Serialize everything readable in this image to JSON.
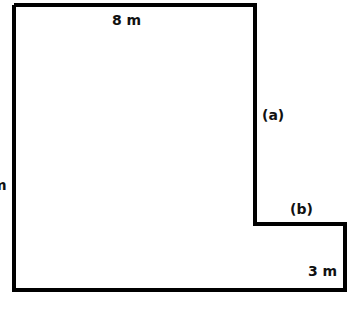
{
  "diagram": {
    "type": "composite-shape-L",
    "stroke_color": "#000000",
    "background": "#ffffff",
    "labels": {
      "top": "8 m",
      "a": "(a)",
      "b": "(b)",
      "right_small": "3 m",
      "left_partial": "m",
      "bottom_partial": ""
    }
  }
}
